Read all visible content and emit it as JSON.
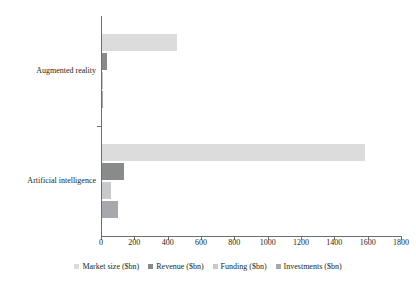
{
  "chart_data": {
    "type": "bar",
    "orientation": "horizontal",
    "title": "",
    "subtitle": "",
    "xlabel": "",
    "ylabel": "",
    "categories": [
      "Augmented reality",
      "Artificial intelligence"
    ],
    "series": [
      {
        "name": "Market size ($bn)",
        "color": "#dcdcdc",
        "values": [
          450,
          1580
        ]
      },
      {
        "name": "Revenue ($bn)",
        "color": "#888a8c",
        "values": [
          30,
          130
        ]
      },
      {
        "name": "Funding ($bn)",
        "color": "#c8c9ca",
        "values": [
          5,
          55
        ]
      },
      {
        "name": "Investments ($bn)",
        "color": "#a6a8ab",
        "values": [
          2,
          95
        ]
      }
    ],
    "xlim": [
      0,
      1800
    ],
    "xticks": [
      0,
      200,
      400,
      600,
      800,
      1000,
      1200,
      1400,
      1600,
      1800
    ],
    "xtick_labels": [
      "0",
      "200",
      "400",
      "600",
      "800",
      "1000",
      "1200",
      "1400",
      "1600",
      "1800"
    ],
    "grid": false,
    "legend_position": "bottom",
    "legend_entries": [
      "Market size ($bn)",
      "Revenue ($bn)",
      "Funding ($bn)",
      "Investments ($bn)"
    ]
  },
  "axis": {
    "line_color": "#6d6e71"
  }
}
